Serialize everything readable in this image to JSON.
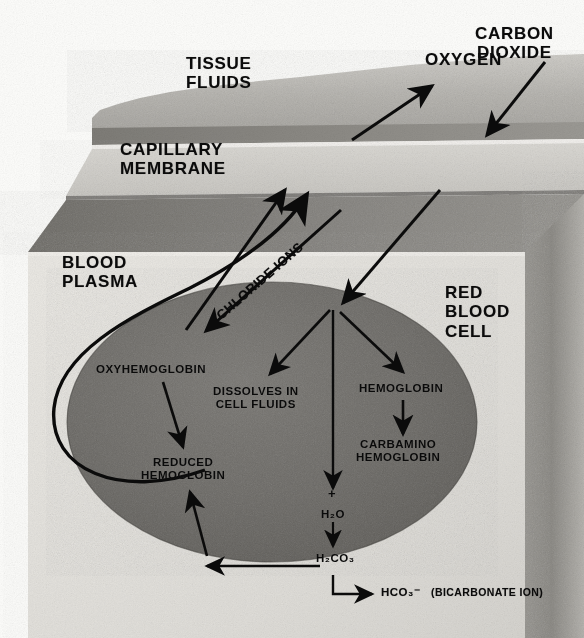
{
  "figure": {
    "type": "biology-diagram"
  },
  "regions": {
    "tissue_fluids": "TISSUE\nFLUIDS",
    "capillary_membrane": "CAPILLARY\nMEMBRANE",
    "blood_plasma": "BLOOD\nPLASMA",
    "red_blood_cell": "RED\nBLOOD\nCELL"
  },
  "gas_labels": {
    "oxygen": "OXYGEN",
    "carbon_dioxide": "CARBON\nDIOXIDE"
  },
  "transport_label": {
    "chloride_ions": "CHLORIDE IONS"
  },
  "cell_labels": {
    "oxyhemoglobin": "OXYHEMOGLOBIN",
    "reduced_hemoglobin": "REDUCED\nHEMOGLOBIN",
    "dissolves_in_cell_fluids": "DISSOLVES IN\nCELL FLUIDS",
    "hemoglobin": "HEMOGLOBIN",
    "carbamino_hemoglobin": "CARBAMINO\nHEMOGLOBIN"
  },
  "chemistry": {
    "plus": "+",
    "water": "H₂O",
    "carbonic_acid": "H₂CO₃",
    "bicarbonate_formula": "HCO₃⁻",
    "bicarbonate_name": "(BICARBONATE ION)"
  },
  "colors": {
    "background": "#fdfdfb",
    "tissue_fluid_band": "#b9b7b2",
    "membrane_top_dark": "#8d8b86",
    "membrane_face": "#d2d0cb",
    "plasma_top_dark": "#8a8883",
    "plasma_face": "#e2e0db",
    "box_right_face": "#8c8a85",
    "cell_fill": "#6d6b67",
    "ink": "#0b0b0b"
  }
}
